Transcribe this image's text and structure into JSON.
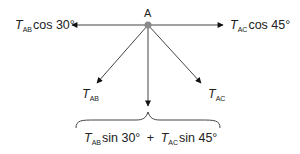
{
  "diagram": {
    "point": {
      "label": "A"
    },
    "labels": {
      "left": {
        "symbol": "T",
        "sub": "AB",
        "func": "cos 30°"
      },
      "right": {
        "symbol": "T",
        "sub": "AC",
        "func": "cos 45°"
      },
      "ab": {
        "symbol": "T",
        "sub": "AB"
      },
      "ac": {
        "symbol": "T",
        "sub": "AC"
      },
      "sum": {
        "t1": "T",
        "s1": "AB",
        "f1": "sin 30°",
        "plus": "+",
        "t2": "T",
        "s2": "AC",
        "f2": "sin 45°"
      }
    },
    "colors": {
      "line": "#444444",
      "point": "#8a8a8a",
      "text": "#222222"
    }
  }
}
